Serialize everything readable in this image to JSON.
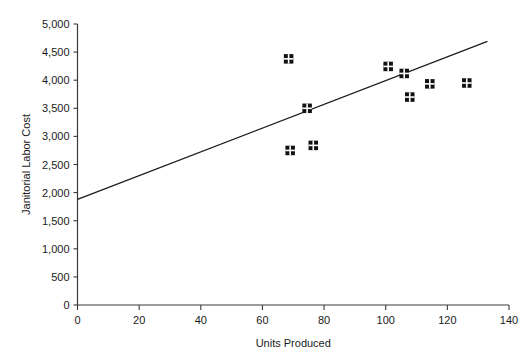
{
  "chart_data": {
    "type": "scatter",
    "title": "",
    "xlabel": "Units Produced",
    "ylabel": "Janitorial Labor Cost",
    "xlim": [
      0,
      140
    ],
    "ylim": [
      0,
      5000
    ],
    "xticks": [
      0,
      20,
      40,
      60,
      80,
      100,
      120,
      140
    ],
    "xtick_labels": [
      "0",
      "20",
      "40",
      "60",
      "80",
      "100",
      "120",
      "140"
    ],
    "yticks": [
      0,
      500,
      1000,
      1500,
      2000,
      2500,
      3000,
      3500,
      4000,
      4500,
      5000
    ],
    "ytick_labels": [
      "0",
      "500",
      "1,000",
      "1,500",
      "2,000",
      "2,500",
      "3,000",
      "3,500",
      "4,000",
      "4,500",
      "5,000"
    ],
    "grid": false,
    "legend": false,
    "marker_style": "crossed-square",
    "marker_color": "#111111",
    "line_color": "#1a1a1a",
    "points": [
      {
        "x": 68.5,
        "y": 4380
      },
      {
        "x": 69.0,
        "y": 2750
      },
      {
        "x": 74.5,
        "y": 3500
      },
      {
        "x": 76.5,
        "y": 2840
      },
      {
        "x": 100.8,
        "y": 4245
      },
      {
        "x": 106.0,
        "y": 4120
      },
      {
        "x": 107.8,
        "y": 3700
      },
      {
        "x": 114.3,
        "y": 3935
      },
      {
        "x": 126.3,
        "y": 3950
      }
    ],
    "trend_line": {
      "x_start": 0,
      "y_start": 1880,
      "x_end": 133,
      "y_end": 4690
    }
  }
}
